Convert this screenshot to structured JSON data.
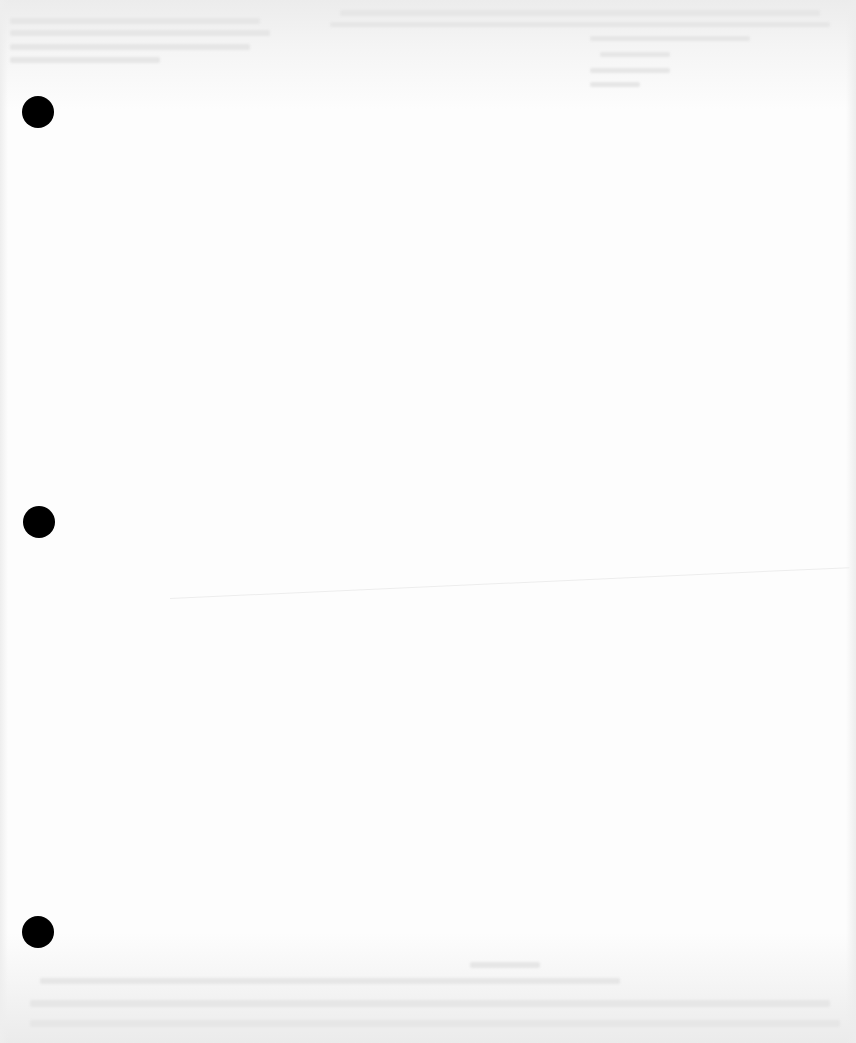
{
  "document": {
    "type": "scanned blank sheet",
    "paper_color": "#fdfdfd",
    "hole_punch_color": "#000000",
    "hole_punches": [
      {
        "position": "top",
        "cx": 38,
        "cy": 112
      },
      {
        "position": "middle",
        "cx": 39,
        "cy": 522
      },
      {
        "position": "bottom",
        "cx": 38,
        "cy": 932
      }
    ],
    "show_through_text": {
      "legible": false,
      "regions": [
        "top-left",
        "top-right",
        "bottom"
      ]
    },
    "crease_visible": true
  }
}
